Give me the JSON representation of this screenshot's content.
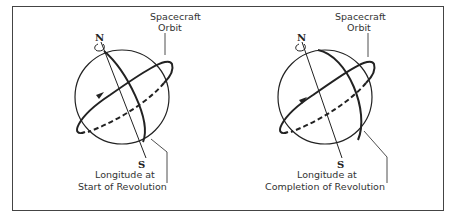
{
  "diagram": {
    "panels": [
      {
        "id": "start",
        "orbit_label_line1": "Spacecraft",
        "orbit_label_line2": "Orbit",
        "north_label": "N",
        "south_label": "S",
        "longitude_label_line1": "Longitude at",
        "longitude_label_line2": "Start of Revolution"
      },
      {
        "id": "completion",
        "orbit_label_line1": "Spacecraft",
        "orbit_label_line2": "Orbit",
        "north_label": "N",
        "south_label": "S",
        "longitude_label_line1": "Longitude at",
        "longitude_label_line2": "Completion of Revolution"
      }
    ],
    "colors": {
      "line": "#222222",
      "frame": "#444444",
      "text": "#333333"
    }
  }
}
